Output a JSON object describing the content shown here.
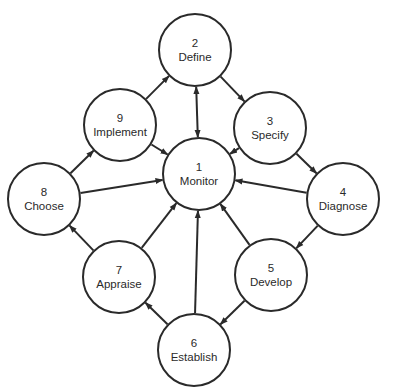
{
  "diagram": {
    "type": "cycle-with-hub",
    "nodes": [
      {
        "id": 1,
        "number": "1",
        "label": "Monitor",
        "cx": 199,
        "cy": 174
      },
      {
        "id": 2,
        "number": "2",
        "label": "Define",
        "cx": 195,
        "cy": 50
      },
      {
        "id": 3,
        "number": "3",
        "label": "Specify",
        "cx": 270,
        "cy": 128
      },
      {
        "id": 4,
        "number": "4",
        "label": "Diagnose",
        "cx": 343,
        "cy": 199
      },
      {
        "id": 5,
        "number": "5",
        "label": "Develop",
        "cx": 271,
        "cy": 275
      },
      {
        "id": 6,
        "number": "6",
        "label": "Establish",
        "cx": 194,
        "cy": 350
      },
      {
        "id": 7,
        "number": "7",
        "label": "Appraise",
        "cx": 119,
        "cy": 277
      },
      {
        "id": 8,
        "number": "8",
        "label": "Choose",
        "cx": 44,
        "cy": 199
      },
      {
        "id": 9,
        "number": "9",
        "label": "Implement",
        "cx": 120,
        "cy": 125
      }
    ],
    "edges": [
      {
        "from": 2,
        "to": 3
      },
      {
        "from": 3,
        "to": 4
      },
      {
        "from": 4,
        "to": 5
      },
      {
        "from": 5,
        "to": 6
      },
      {
        "from": 6,
        "to": 7
      },
      {
        "from": 7,
        "to": 8
      },
      {
        "from": 8,
        "to": 9
      },
      {
        "from": 9,
        "to": 2
      },
      {
        "from": 2,
        "to": 1,
        "bidirectional": true
      },
      {
        "from": 3,
        "to": 1
      },
      {
        "from": 4,
        "to": 1
      },
      {
        "from": 5,
        "to": 1
      },
      {
        "from": 6,
        "to": 1
      },
      {
        "from": 7,
        "to": 1
      },
      {
        "from": 8,
        "to": 1
      },
      {
        "from": 9,
        "to": 1
      }
    ],
    "colors": {
      "stroke": "#2a2a2a",
      "background": "#ffffff"
    }
  }
}
